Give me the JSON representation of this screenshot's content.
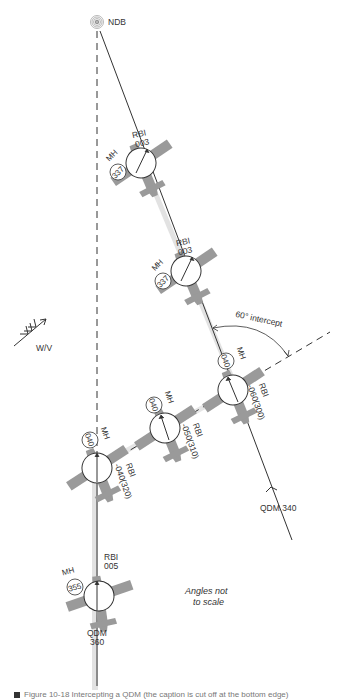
{
  "diagram": {
    "beacon": {
      "label": "NDB",
      "icon": "ndb-beacon-icon"
    },
    "wind": {
      "label": "W/V",
      "icon": "wind-arrow-icon"
    },
    "intercept": {
      "label": "60° intercept"
    },
    "note": {
      "line1": "Angles not",
      "line2": "to scale"
    },
    "tracks": {
      "qdm_340": {
        "label": "QDM 340"
      },
      "qdm_360": {
        "line1": "QDM",
        "line2": "360"
      }
    },
    "aircraft": [
      {
        "id": "ac1",
        "mh_label": "MH",
        "mh": "337",
        "rbi_label": "RBI",
        "rbi": "003"
      },
      {
        "id": "ac2",
        "mh_label": "MH",
        "mh": "337",
        "rbi_label": "RBI",
        "rbi": "003"
      },
      {
        "id": "ac3",
        "mh_label": "MH",
        "mh": "040",
        "rbi_label": "RBI",
        "rbi": "-060(300)"
      },
      {
        "id": "ac4",
        "mh_label": "MH",
        "mh": "040",
        "rbi_label": "RBI",
        "rbi": "-050(310)"
      },
      {
        "id": "ac5",
        "mh_label": "MH",
        "mh": "040",
        "rbi_label": "RBI",
        "rbi": "-040(320)"
      },
      {
        "id": "ac6",
        "mh_label": "MH",
        "mh": "355",
        "rbi_label": "RBI",
        "rbi": "005"
      }
    ],
    "colors": {
      "aircraft_fill": "#9a9a9a",
      "track_band": "#d9d9d9",
      "line": "#333333"
    }
  },
  "caption": {
    "text": "Figure 10-18 Intercepting a QDM (the caption is cut off at the bottom edge)"
  }
}
